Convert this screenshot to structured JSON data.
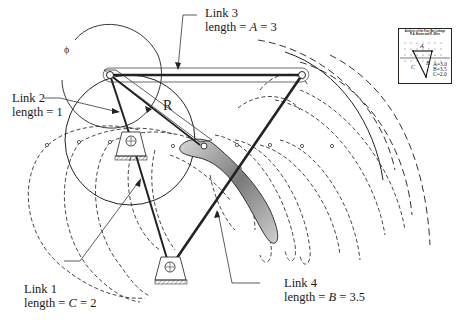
{
  "figure": {
    "type": "four-bar linkage coupler curve diagram",
    "labels": {
      "link3": {
        "line1": "Link 3",
        "line2_prefix": "length = ",
        "var": "A",
        "line2_suffix": " = 3"
      },
      "link2": {
        "line1": "Link 2",
        "line2": "length  = 1"
      },
      "link1": {
        "line1": "Link 1",
        "line2_prefix": "length = ",
        "var": "C",
        "line2_suffix": " = 2"
      },
      "link4": {
        "line1": "Link 4",
        "line2_prefix": "length = ",
        "var": "B",
        "line2_suffix": " = 3.5"
      },
      "radius": "R",
      "angle": "ϕ"
    },
    "inset": {
      "title_line1": "Analysis of the Four Bar Linkage",
      "title_line2": "R.A. Brown and R. Miles",
      "label_A": "A",
      "label_B": "B",
      "label_C": "C",
      "values": [
        "A=3.0",
        "B=3.5",
        "C=2.0"
      ]
    }
  }
}
